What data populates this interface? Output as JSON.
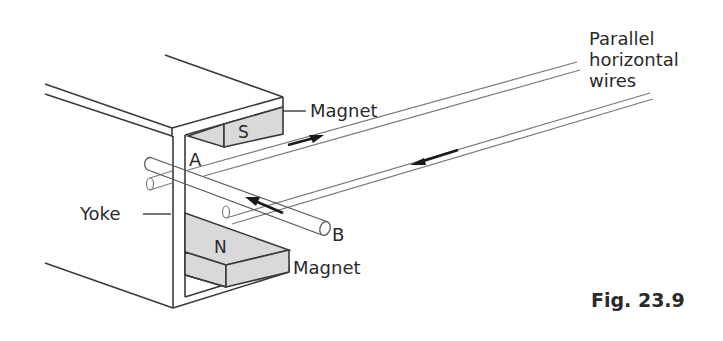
{
  "figure": {
    "caption": "Fig. 23.9",
    "labels": {
      "magnet_top": "Magnet",
      "magnet_bottom": "Magnet",
      "yoke": "Yoke",
      "wires_line1": "Parallel",
      "wires_line2": "horizontal",
      "wires_line3": "wires",
      "point_a": "A",
      "point_b": "B",
      "pole_south": "S",
      "pole_north": "N"
    },
    "colors": {
      "line": "#3a3a3a",
      "wire": "#7a7a7a",
      "magnet_fill": "#d9d9d9",
      "arrow": "#1a1a1a",
      "background": "#ffffff"
    },
    "arrows": [
      {
        "location": "upper wire",
        "direction": "away from yoke (right)"
      },
      {
        "location": "lower wire",
        "direction": "toward yoke (left)"
      },
      {
        "location": "rod AB",
        "direction": "from B toward A"
      }
    ]
  }
}
